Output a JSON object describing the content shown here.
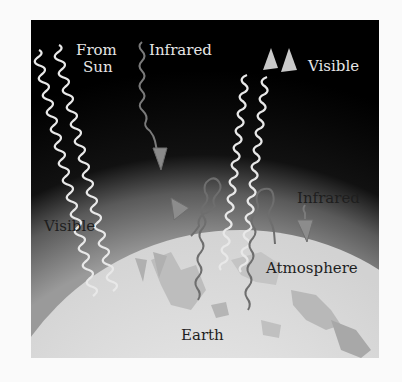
{
  "diagram": {
    "labels": {
      "from_sun_line1": "From",
      "from_sun_line2": "Sun",
      "infrared_top": "Infrared",
      "visible_top": "Visible",
      "visible_left": "Visible",
      "infrared_right": "Infrared",
      "atmosphere": "Atmosphere",
      "earth": "Earth"
    },
    "colors": {
      "space": "#000000",
      "atmosphere": "#9a9a9a",
      "earth": "#dedede",
      "visible_wave": "#e8e8e8",
      "infrared_wave": "#6e6e6e",
      "background": "#fafafa"
    }
  }
}
